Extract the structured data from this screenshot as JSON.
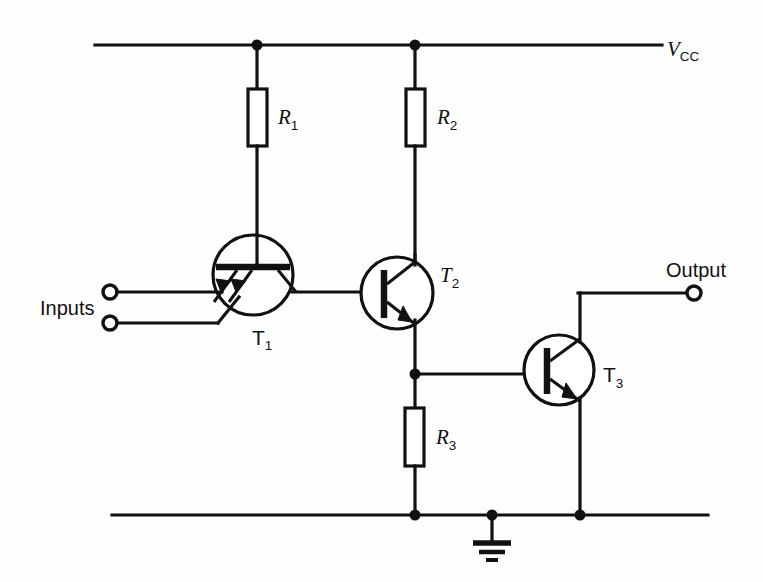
{
  "diagram": {
    "type": "circuit-schematic",
    "background_color": "#ffffff",
    "line_color": "#111111"
  },
  "labels": {
    "supply_rail": "V",
    "supply_rail_sub": "CC",
    "inputs": "Inputs",
    "output": "Output",
    "r1": "R",
    "r1_sub": "1",
    "r2": "R",
    "r2_sub": "2",
    "r3": "R",
    "r3_sub": "3",
    "t1": "T",
    "t1_sub": "1",
    "t2": "T",
    "t2_sub": "2",
    "t3": "T",
    "t3_sub": "3"
  },
  "components": {
    "resistors": [
      {
        "id": "R1",
        "label": "R",
        "subscript": "1",
        "x": 248,
        "y": 89,
        "w": 19,
        "h": 57
      },
      {
        "id": "R2",
        "label": "R",
        "subscript": "2",
        "x": 406,
        "y": 89,
        "w": 19,
        "h": 57
      },
      {
        "id": "R3",
        "label": "R",
        "subscript": "3",
        "x": 405,
        "y": 408,
        "w": 19,
        "h": 58
      }
    ],
    "transistors": [
      {
        "id": "T1",
        "label": "T",
        "subscript": "1",
        "kind": "npn-multi-emitter",
        "cx": 253,
        "cy": 275,
        "r": 40
      },
      {
        "id": "T2",
        "label": "T",
        "subscript": "2",
        "kind": "npn",
        "cx": 397,
        "cy": 293,
        "r": 36
      },
      {
        "id": "T3",
        "label": "T",
        "subscript": "3",
        "kind": "npn",
        "cx": 559,
        "cy": 370,
        "r": 35
      }
    ],
    "terminals": [
      {
        "id": "input-a",
        "name": "input-terminal-upper",
        "cx": 110,
        "cy": 292,
        "r": 7
      },
      {
        "id": "input-b",
        "name": "input-terminal-lower",
        "cx": 110,
        "cy": 323,
        "r": 7
      },
      {
        "id": "output",
        "name": "output-terminal",
        "cx": 694,
        "cy": 293,
        "r": 7
      }
    ],
    "ground": {
      "x": 492,
      "y": 515,
      "stem_bottom": 543
    },
    "junction_nodes": [
      {
        "name": "node-vcc-r1",
        "x": 257,
        "y": 45
      },
      {
        "name": "node-vcc-r2",
        "x": 415,
        "y": 45
      },
      {
        "name": "node-t2-emitter-r3",
        "x": 415,
        "y": 374
      },
      {
        "name": "node-gnd-r3",
        "x": 415,
        "y": 515
      },
      {
        "name": "node-gnd-ground",
        "x": 492,
        "y": 515
      },
      {
        "name": "node-gnd-t3",
        "x": 580,
        "y": 515
      }
    ],
    "rails": [
      {
        "name": "vcc-rail",
        "x1": 95,
        "y1": 45,
        "x2": 662,
        "y2": 45
      },
      {
        "name": "ground-rail",
        "x1": 112,
        "y1": 515,
        "x2": 708,
        "y2": 515
      }
    ]
  }
}
